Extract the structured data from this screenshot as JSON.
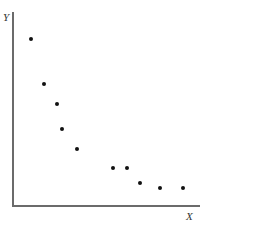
{
  "chart_data": {
    "type": "scatter",
    "title": "",
    "xlabel": "X",
    "ylabel": "Y",
    "grid": false,
    "legend": null,
    "x": [
      1,
      2,
      3,
      3.4,
      4.5,
      7.3,
      8.3,
      9.3,
      10.8,
      12.6
    ],
    "y": [
      8.7,
      6.3,
      5.3,
      4,
      2.9,
      1.9,
      1.9,
      1.1,
      0.9,
      0.9
    ],
    "px": [
      [
        31,
        39
      ],
      [
        44,
        84
      ],
      [
        57,
        104
      ],
      [
        62,
        129
      ],
      [
        77,
        149
      ],
      [
        113,
        168
      ],
      [
        127,
        168
      ],
      [
        140,
        183
      ],
      [
        160,
        188
      ],
      [
        183,
        188
      ]
    ]
  },
  "labels": {
    "x": "X",
    "y": "Y"
  }
}
